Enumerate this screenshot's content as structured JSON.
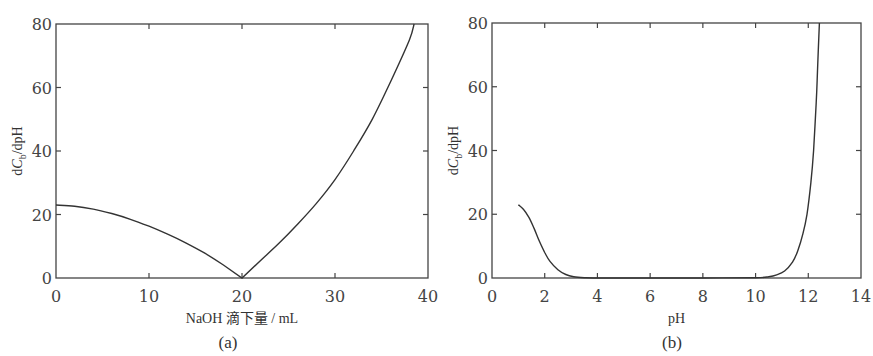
{
  "chart_data": [
    {
      "id": "a",
      "type": "line",
      "caption": "(a)",
      "xlabel": "NaOH 滴下量 / mL",
      "ylabel_prefix": "dC",
      "ylabel_sub": "b",
      "ylabel_suffix": "/dpH",
      "xlim": [
        0,
        40
      ],
      "ylim": [
        0,
        80
      ],
      "xticks": [
        0,
        10,
        20,
        30,
        40
      ],
      "yticks": [
        0,
        20,
        40,
        60,
        80
      ],
      "grid": false,
      "series": [
        {
          "name": "dCb/dpH vs NaOH volume",
          "x": [
            0,
            2,
            4,
            6,
            8,
            10,
            12,
            14,
            16,
            18,
            20,
            22,
            24,
            26,
            28,
            30,
            32,
            34,
            36,
            38,
            38.5
          ],
          "y": [
            23,
            22.6,
            21.7,
            20.3,
            18.5,
            16.3,
            13.8,
            11,
            7.8,
            4.1,
            0,
            5.5,
            11,
            17,
            23.5,
            31,
            40,
            50,
            62,
            75,
            80
          ]
        }
      ]
    },
    {
      "id": "b",
      "type": "line",
      "caption": "(b)",
      "xlabel": "pH",
      "ylabel_prefix": "dC",
      "ylabel_sub": "b",
      "ylabel_suffix": "/dpH",
      "xlim": [
        0,
        14
      ],
      "ylim": [
        0,
        80
      ],
      "xticks": [
        0,
        2,
        4,
        6,
        8,
        10,
        12,
        14
      ],
      "yticks": [
        0,
        20,
        40,
        60,
        80
      ],
      "grid": false,
      "series": [
        {
          "name": "dCb/dpH vs pH",
          "x": [
            1.0,
            1.2,
            1.4,
            1.6,
            1.8,
            2.0,
            2.2,
            2.5,
            2.8,
            3.1,
            3.5,
            4.0,
            6,
            8,
            10.0,
            10.5,
            10.8,
            11.1,
            11.4,
            11.6,
            11.8,
            11.95,
            12.1,
            12.2,
            12.3,
            12.35,
            12.42
          ],
          "y": [
            23,
            21.5,
            19,
            15.5,
            11.5,
            8,
            5.2,
            2.6,
            1.1,
            0.4,
            0.1,
            0,
            0,
            0,
            0.1,
            0.4,
            1,
            2.2,
            5,
            8.5,
            14,
            20,
            30,
            40,
            55,
            65,
            80
          ]
        }
      ]
    }
  ]
}
